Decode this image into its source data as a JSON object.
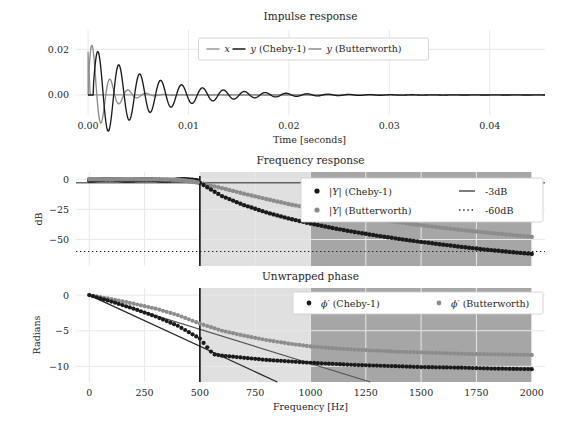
{
  "figure": {
    "width": 569,
    "height": 426,
    "background": "#ffffff"
  },
  "colors": {
    "x_signal": "#999999",
    "cheby": "#1a1a1a",
    "butterworth": "#8c8c8c",
    "grid": "#e8e8e8",
    "text": "#262626",
    "band_light": "#e0e0e0",
    "band_dark": "#a6a6a6",
    "legend_face": "#ffffff",
    "legend_edge": "#cccccc"
  },
  "chart_data": [
    {
      "id": "impulse-response",
      "type": "line",
      "title": "Impulse response",
      "xlabel": "Time [seconds]",
      "ylabel": "",
      "xlim": [
        -0.0012,
        0.0455
      ],
      "ylim": [
        -0.0088,
        0.0285
      ],
      "xticks": [
        0.0,
        0.01,
        0.02,
        0.03,
        0.04
      ],
      "xticklabels": [
        "0.00",
        "0.01",
        "0.02",
        "0.03",
        "0.04"
      ],
      "yticks": [
        0.0,
        0.02
      ],
      "yticklabels": [
        "0.00",
        "0.02"
      ],
      "grid": true,
      "legend_position": "upper center",
      "series": [
        {
          "name": "x",
          "color": "#999999",
          "description": "input impulse, single narrow spike at t=0 rising to 0.019 then returning to 0"
        },
        {
          "name": "y (Cheby-1)",
          "color": "#1a1a1a",
          "description": "damped ringing oscillation, first peak 0.019 at t=0.0021, decaying to ~0 by t=0.020",
          "envelope_peak": 0.019,
          "ring_frequency_hz": 480,
          "decay_time_s": 0.012
        },
        {
          "name": "y (Butterworth)",
          "color": "#8c8c8c",
          "description": "damped ringing oscillation, first peak 0.0255 at t=0.0013, faster decay, ~0 by t=0.010",
          "envelope_peak": 0.0255,
          "ring_frequency_hz": 560,
          "decay_time_s": 0.006
        }
      ]
    },
    {
      "id": "frequency-response",
      "type": "line",
      "title": "Frequency response",
      "xlabel": "",
      "ylabel": "dB",
      "xlim": [
        -60,
        2060
      ],
      "ylim": [
        -72,
        6
      ],
      "xticks": [
        0,
        250,
        500,
        750,
        1000,
        1250,
        1500,
        1750,
        2000
      ],
      "yticks": [
        0,
        -25,
        -50
      ],
      "yticklabels": [
        "0",
        "−25",
        "−50"
      ],
      "grid": true,
      "legend_position": "upper right",
      "reference_lines": [
        {
          "name": "-3dB",
          "value": -3,
          "style": "solid",
          "color": "#262626"
        },
        {
          "name": "-60dB",
          "value": -60,
          "style": "dotted",
          "color": "#262626"
        }
      ],
      "vertical_markers": [
        {
          "value": 500,
          "color": "#1a1a1a"
        }
      ],
      "shaded_bands": [
        {
          "from": 500,
          "to": 1000,
          "color": "#e0e0e0",
          "label": "transition band"
        },
        {
          "from": 1000,
          "to": 2000,
          "color": "#a6a6a6",
          "label": "stop band"
        }
      ],
      "series": [
        {
          "name": "|Y| (Cheby-1)",
          "marker": "dot",
          "color": "#1a1a1a",
          "x": [
            0,
            100,
            200,
            300,
            400,
            480,
            500,
            600,
            700,
            800,
            900,
            1000,
            1100,
            1200,
            1300,
            1400,
            1500,
            1600,
            1700,
            1800,
            1900,
            2000
          ],
          "y": [
            -0.6,
            -0.3,
            -0.8,
            -0.3,
            -0.9,
            -0.5,
            -3.0,
            -14.0,
            -21.5,
            -27.5,
            -32.5,
            -36.8,
            -40.5,
            -43.8,
            -46.8,
            -49.5,
            -52.0,
            -54.3,
            -56.5,
            -58.5,
            -60.3,
            -62.0
          ]
        },
        {
          "name": "|Y| (Butterworth)",
          "marker": "dot",
          "color": "#8c8c8c",
          "x": [
            0,
            100,
            200,
            300,
            400,
            500,
            600,
            700,
            800,
            900,
            1000,
            1100,
            1200,
            1300,
            1400,
            1500,
            1600,
            1700,
            1800,
            1900,
            2000
          ],
          "y": [
            -0.05,
            -0.05,
            -0.1,
            -0.2,
            -0.7,
            -3.0,
            -7.4,
            -12.0,
            -16.4,
            -20.5,
            -24.2,
            -27.5,
            -30.5,
            -33.3,
            -35.8,
            -38.2,
            -40.4,
            -42.4,
            -44.3,
            -46.1,
            -47.8
          ]
        }
      ],
      "legend_entries": [
        {
          "label": "|Y| (Cheby-1)",
          "marker": "dot",
          "color": "#1a1a1a"
        },
        {
          "label": "|Y| (Butterworth)",
          "marker": "dot",
          "color": "#8c8c8c"
        },
        {
          "label": "-3dB",
          "marker": "line",
          "color": "#262626"
        },
        {
          "label": "-60dB",
          "marker": "dotted",
          "color": "#262626"
        }
      ]
    },
    {
      "id": "unwrapped-phase",
      "type": "line",
      "title": "Unwrapped phase",
      "xlabel": "Frequency [Hz]",
      "ylabel": "Radians",
      "xlim": [
        -60,
        2060
      ],
      "ylim": [
        -12.2,
        1.0
      ],
      "xticks": [
        0,
        250,
        500,
        750,
        1000,
        1250,
        1500,
        1750,
        2000
      ],
      "xticklabels": [
        "0",
        "250",
        "500",
        "750",
        "1000",
        "1250",
        "1500",
        "1750",
        "2000"
      ],
      "yticks": [
        0,
        -5,
        -10
      ],
      "yticklabels": [
        "0",
        "−5",
        "−10"
      ],
      "grid": true,
      "legend_position": "upper right",
      "vertical_markers": [
        {
          "value": 500,
          "color": "#1a1a1a"
        }
      ],
      "shaded_bands": [
        {
          "from": 500,
          "to": 1000,
          "color": "#e0e0e0",
          "label": "transition band"
        },
        {
          "from": 1000,
          "to": 2000,
          "color": "#a6a6a6",
          "label": "stop band"
        }
      ],
      "reference_lines": [
        {
          "name": "group-delay-1",
          "from": [
            0,
            0
          ],
          "to": [
            850,
            -12.2
          ],
          "style": "solid",
          "color": "#262626"
        },
        {
          "name": "group-delay-2",
          "from": [
            0,
            0
          ],
          "to": [
            1270,
            -12.2
          ],
          "style": "solid",
          "color": "#555555"
        }
      ],
      "series": [
        {
          "name": "ϕ′ (Cheby-1)",
          "marker": "dot",
          "color": "#1a1a1a",
          "x": [
            0,
            100,
            200,
            300,
            400,
            500,
            560,
            600,
            700,
            800,
            900,
            1000,
            1100,
            1200,
            1300,
            1400,
            1500,
            1600,
            1700,
            1800,
            1900,
            2000
          ],
          "y": [
            0,
            -0.9,
            -1.9,
            -3.0,
            -4.3,
            -6.1,
            -8.3,
            -8.5,
            -8.8,
            -9.1,
            -9.3,
            -9.5,
            -9.65,
            -9.8,
            -9.9,
            -10.0,
            -10.1,
            -10.15,
            -10.2,
            -10.3,
            -10.35,
            -10.4
          ]
        },
        {
          "name": "ϕ′ (Butterworth)",
          "marker": "dot",
          "color": "#8c8c8c",
          "x": [
            0,
            100,
            200,
            300,
            400,
            500,
            600,
            700,
            800,
            900,
            1000,
            1100,
            1200,
            1300,
            1400,
            1500,
            1600,
            1700,
            1800,
            1900,
            2000
          ],
          "y": [
            0,
            -0.55,
            -1.2,
            -1.9,
            -2.8,
            -4.0,
            -5.0,
            -5.7,
            -6.3,
            -6.8,
            -7.2,
            -7.45,
            -7.65,
            -7.8,
            -7.95,
            -8.05,
            -8.15,
            -8.25,
            -8.3,
            -8.35,
            -8.4
          ]
        }
      ],
      "legend_entries": [
        {
          "label": "ϕ′ (Cheby-1)",
          "marker": "dot",
          "color": "#1a1a1a"
        },
        {
          "label": "ϕ′ (Butterworth)",
          "marker": "dot",
          "color": "#8c8c8c"
        }
      ]
    }
  ],
  "legends": {
    "impulse": {
      "entries": [
        {
          "label": "x",
          "color": "#999999",
          "italic_first": true
        },
        {
          "label": "y (Cheby-1)",
          "color": "#1a1a1a",
          "italic_first": true
        },
        {
          "label": "y (Butterworth)",
          "color": "#8c8c8c",
          "italic_first": true
        }
      ]
    }
  }
}
